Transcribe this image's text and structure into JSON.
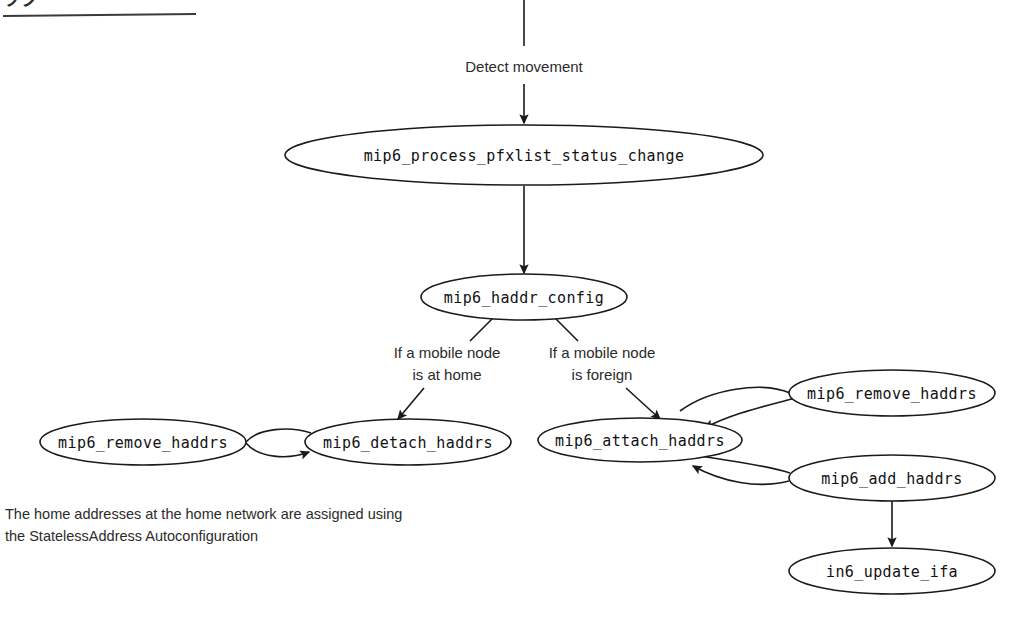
{
  "page": {
    "width": 1016,
    "height": 621,
    "background": "#ffffff",
    "ink_color": "#1a1a1a"
  },
  "header": {
    "cropped_text": "ッグ",
    "has_rule": true
  },
  "nodes": [
    {
      "id": "process_pfxlist",
      "label": "mip6_process_pfxlist_status_change",
      "cx": 524,
      "cy": 155,
      "rx": 239,
      "ry": 30
    },
    {
      "id": "haddr_config",
      "label": "mip6_haddr_config",
      "cx": 524,
      "cy": 297,
      "rx": 103,
      "ry": 23
    },
    {
      "id": "remove_haddrs_left",
      "label": "mip6_remove_haddrs",
      "cx": 143,
      "cy": 442,
      "rx": 103,
      "ry": 23
    },
    {
      "id": "detach_haddrs",
      "label": "mip6_detach_haddrs",
      "cx": 408,
      "cy": 442,
      "rx": 103,
      "ry": 23
    },
    {
      "id": "attach_haddrs",
      "label": "mip6_attach_haddrs",
      "cx": 640,
      "cy": 440,
      "rx": 102,
      "ry": 22
    },
    {
      "id": "remove_haddrs_right",
      "label": "mip6_remove_haddrs",
      "cx": 892,
      "cy": 393,
      "rx": 103,
      "ry": 23
    },
    {
      "id": "add_haddrs",
      "label": "mip6_add_haddrs",
      "cx": 892,
      "cy": 478,
      "rx": 103,
      "ry": 23
    },
    {
      "id": "in6_update_ifa",
      "label": "in6_update_ifa",
      "cx": 892,
      "cy": 571,
      "rx": 103,
      "ry": 23
    }
  ],
  "edge_labels": [
    {
      "id": "detect-movement",
      "text": "Detect movement",
      "x": 524,
      "y": 68
    },
    {
      "id": "branch-home-line1",
      "text": "If a mobile node",
      "x": 447,
      "y": 354
    },
    {
      "id": "branch-home-line2",
      "text": "is at home",
      "x": 447,
      "y": 375
    },
    {
      "id": "branch-foreign-line1",
      "text": "If a mobile node",
      "x": 602,
      "y": 354
    },
    {
      "id": "branch-foreign-line2",
      "text": "is foreign",
      "x": 602,
      "y": 375
    }
  ],
  "caption": {
    "line1": "The home addresses at the home network are assigned using",
    "line2": "the StatelessAddress Autoconfiguration",
    "x": 5,
    "y1": 515,
    "y2": 537
  },
  "edges": [
    {
      "id": "entry-to-process",
      "from": "(top)",
      "to": "process_pfxlist",
      "label": "Detect movement"
    },
    {
      "id": "process-to-haddr-config",
      "from": "process_pfxlist",
      "to": "haddr_config"
    },
    {
      "id": "haddr-config-to-detach",
      "from": "haddr_config",
      "to": "detach_haddrs",
      "label": "If a mobile node is at home"
    },
    {
      "id": "haddr-config-to-attach",
      "from": "haddr_config",
      "to": "attach_haddrs",
      "label": "If a mobile node is foreign"
    },
    {
      "id": "remove-left-to-detach",
      "from": "remove_haddrs_left",
      "to": "detach_haddrs"
    },
    {
      "id": "remove-right-to-attach",
      "from": "remove_haddrs_right",
      "to": "attach_haddrs"
    },
    {
      "id": "add-to-attach",
      "from": "add_haddrs",
      "to": "attach_haddrs"
    },
    {
      "id": "add-to-in6-update",
      "from": "add_haddrs",
      "to": "in6_update_ifa"
    }
  ]
}
